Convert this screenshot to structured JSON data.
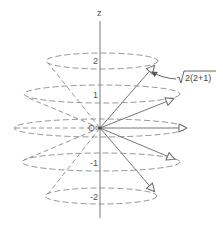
{
  "diagram": {
    "axis_label": "z",
    "origin_label": "O",
    "magnitude_label": "√2(2+1)",
    "magnitude_radicand": "2(2+1)",
    "levels": [
      {
        "m": 2,
        "label": "2"
      },
      {
        "m": 1,
        "label": "1"
      },
      {
        "m": 0,
        "label": ""
      },
      {
        "m": -1,
        "label": "-1"
      },
      {
        "m": -2,
        "label": "-2"
      }
    ],
    "colors": {
      "axis": "#777777",
      "ellipse": "#8a8a8a",
      "vector": "#777777",
      "text": "#555555"
    }
  }
}
